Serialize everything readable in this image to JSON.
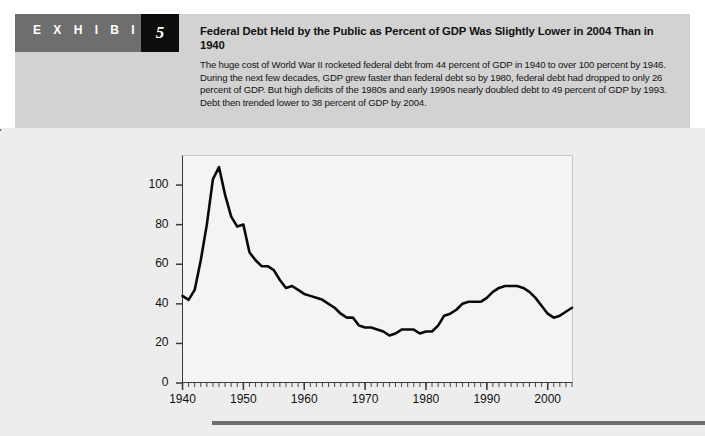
{
  "exhibit": {
    "label": "E X H I B I T",
    "number": "5"
  },
  "header": {
    "title": "Federal Debt Held by the Public as Percent of GDP Was Slightly Lower in 2004 Than in 1940",
    "description": "The huge cost of World War II rocketed federal debt from 44 percent of GDP in 1940 to over 100 percent by 1946. During the next few decades, GDP grew faster than federal debt so by 1980, federal debt had dropped to only 26 percent of GDP. But high deficits of the 1980s and early 1990s nearly doubled debt to 49 percent of GDP by 1993. Debt then trended lower to 38 percent of GDP by 2004."
  },
  "colors": {
    "header_panel": "#d2d2d2",
    "exhibit_bar": "#6e6e6e",
    "exhibit_number_box": "#0d0d0d",
    "chart_background": "#ededed",
    "plot_background": "#f4f4f4",
    "line": "#0a0a0a",
    "axis": "#3a3a3a",
    "rule": "#6e6e6e"
  },
  "chart_data": {
    "type": "line",
    "title": "",
    "xlabel": "",
    "ylabel": "Debt as percent of GDP",
    "xlim": [
      1940,
      2004
    ],
    "ylim": [
      0,
      112
    ],
    "grid": false,
    "legend": "none",
    "ytick_labels": [
      "0",
      "20",
      "40",
      "60",
      "80",
      "100"
    ],
    "ytick_values": [
      0,
      20,
      40,
      60,
      80,
      100
    ],
    "xtick_labels": [
      "1940",
      "1950",
      "1960",
      "1970",
      "1980",
      "1990",
      "2000"
    ],
    "xtick_values": [
      1940,
      1950,
      1960,
      1970,
      1980,
      1990,
      2000
    ],
    "minor_tick_interval": 1,
    "series": [
      {
        "name": "Federal debt held by the public",
        "x": [
          1940,
          1941,
          1942,
          1943,
          1944,
          1945,
          1946,
          1947,
          1948,
          1949,
          1950,
          1951,
          1952,
          1953,
          1954,
          1955,
          1956,
          1957,
          1958,
          1959,
          1960,
          1961,
          1962,
          1963,
          1964,
          1965,
          1966,
          1967,
          1968,
          1969,
          1970,
          1971,
          1972,
          1973,
          1974,
          1975,
          1976,
          1977,
          1978,
          1979,
          1980,
          1981,
          1982,
          1983,
          1984,
          1985,
          1986,
          1987,
          1988,
          1989,
          1990,
          1991,
          1992,
          1993,
          1994,
          1995,
          1996,
          1997,
          1998,
          1999,
          2000,
          2001,
          2002,
          2003,
          2004
        ],
        "values": [
          44,
          42,
          47,
          62,
          80,
          103,
          109,
          95,
          84,
          79,
          80,
          66,
          62,
          59,
          59,
          57,
          52,
          48,
          49,
          47,
          45,
          44,
          43,
          42,
          40,
          38,
          35,
          33,
          33,
          29,
          28,
          28,
          27,
          26,
          24,
          25,
          27,
          27,
          27,
          25,
          26,
          26,
          29,
          34,
          35,
          37,
          40,
          41,
          41,
          41,
          43,
          46,
          48,
          49,
          49,
          49,
          48,
          46,
          43,
          39,
          35,
          33,
          34,
          36,
          38
        ]
      }
    ],
    "annotations": []
  }
}
